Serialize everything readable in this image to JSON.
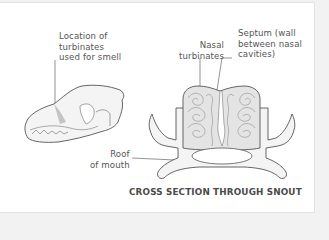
{
  "diagram": {
    "caption": "CROSS SECTION THROUGH SNOUT",
    "labels": {
      "turbinates_location": "Location of\nturbinates\nused for smell",
      "nasal_turbinates": "Nasal\nturbinates",
      "septum": "Septum (wall\nbetween nasal\ncavities)",
      "roof_of_mouth": "Roof\nof mouth"
    },
    "figures": [
      "dog-skull-side-view",
      "snout-cross-section"
    ],
    "colors": {
      "outline": "#555555",
      "fill": "#f1f1f1",
      "turbinate_fill": "#d8d8d8",
      "highlight": "#c4c4c4",
      "text": "#555555"
    }
  }
}
